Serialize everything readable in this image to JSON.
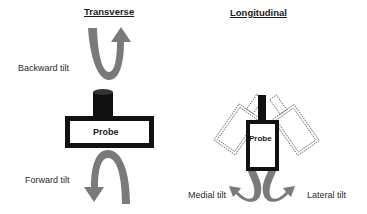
{
  "transverse": {
    "title": "Transverse",
    "probe_label": "Probe",
    "backward_label": "Backward tilt",
    "forward_label": "Forward tilt"
  },
  "longitudinal": {
    "title": "Longitudinal",
    "probe_label": "Probe",
    "medial_label": "Medial tilt",
    "lateral_label": "Lateral tilt"
  },
  "colors": {
    "arrow": "#7a7a7a",
    "probe_outline": "#111111",
    "dashed_outline": "#555555"
  }
}
